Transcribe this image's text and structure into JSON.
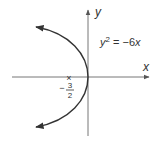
{
  "diagram": {
    "equation": {
      "lhs_var": "y",
      "exponent": "2",
      "rest": " = −6",
      "rhs_var": "x"
    },
    "axes": {
      "x_label": "x",
      "y_label": "y"
    },
    "focus_marker": {
      "symbol": "×",
      "sign": "−",
      "numerator": "3",
      "denominator": "2"
    },
    "colors": {
      "axis": "#777777",
      "curve": "#333333",
      "text": "#333333"
    }
  }
}
